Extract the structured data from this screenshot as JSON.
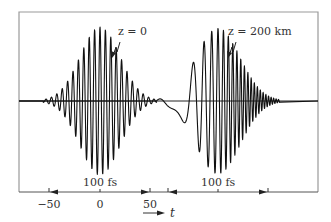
{
  "figure": {
    "frame": {
      "x1": 19,
      "y1": 12,
      "x2": 318,
      "y2": 192
    },
    "baseline_y": 101,
    "colors": {
      "frame": "#999999",
      "wave": "#111111",
      "text": "#333333",
      "axis": "#555555"
    }
  },
  "pulses": [
    {
      "id": "pulse-z0",
      "label": "z = 0",
      "label_pos": {
        "x": 118,
        "y": 35
      },
      "pointer": {
        "x1": 120,
        "y1": 42,
        "x2": 112,
        "y2": 58
      },
      "center_x": 100,
      "amplitude": 74,
      "half_width": 42,
      "period": 5.4,
      "chirp": 0
    },
    {
      "id": "pulse-z200",
      "label": "z = 200 km",
      "label_pos": {
        "x": 228,
        "y": 35
      },
      "pointer": {
        "x1": 236,
        "y1": 42,
        "x2": 228,
        "y2": 58
      },
      "center_x": 218,
      "amplitude": 73,
      "half_width": 46,
      "period": 5.8,
      "chirp": 0.012
    }
  ],
  "axis": {
    "y": 192,
    "ticks": [
      {
        "x": 49,
        "label": "−50"
      },
      {
        "x": 100,
        "label": "0"
      },
      {
        "x": 150,
        "label": "50"
      }
    ],
    "tick_label_y": 208,
    "variable": "t",
    "variable_arrow": {
      "x1": 143,
      "x2": 165,
      "y": 213
    }
  },
  "duration_markers": [
    {
      "label": "100 fs",
      "x1": 49,
      "x2": 150,
      "mid": 100,
      "label_y": 186
    },
    {
      "label": "100 fs",
      "x1": 168,
      "x2": 268,
      "mid": 218,
      "label_y": 186
    }
  ]
}
